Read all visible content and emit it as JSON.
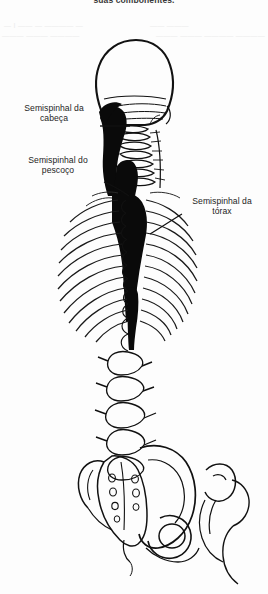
{
  "figure": {
    "title_fragment": "suas componentes.",
    "background_color": "#fdfdfd",
    "ink_color": "#111111",
    "muscle_fill_color": "#0a0a0a",
    "view": "posterior view of axial skeleton",
    "width": 268,
    "height": 594
  },
  "labels": [
    {
      "id": "semispinalis-capitis",
      "text": "Semispinhal da\ncabeça",
      "x": 14,
      "y": 104,
      "align": "center",
      "leader": "horizontal",
      "leader_from": [
        100,
        126
      ],
      "leader_to": [
        128,
        126
      ]
    },
    {
      "id": "semispinalis-cervicis",
      "text": "Semispinhal do\npescoço",
      "x": 16,
      "y": 156,
      "align": "center",
      "leader": "diagonal",
      "leader_from": [
        104,
        182
      ],
      "leader_to": [
        128,
        194
      ]
    },
    {
      "id": "semispinalis-thoracis",
      "text": "Semispinhal da\ntórax",
      "x": 183,
      "y": 197,
      "align": "center",
      "leader": "diagonal",
      "leader_from": [
        180,
        216
      ],
      "leader_to": [
        150,
        232
      ]
    }
  ],
  "ghost_text": [
    {
      "text": "— I ——  — ————  —",
      "x": 4,
      "y": 26
    },
    {
      "text": "———    ———  ————",
      "x": 2,
      "y": 36
    },
    {
      "text": "——  ———",
      "x": 4,
      "y": 46
    },
    {
      "text": "———  ——— ———— ————",
      "x": 150,
      "y": 24
    },
    {
      "text": "———— ——  ——— ————",
      "x": 156,
      "y": 34
    }
  ],
  "anatomy_parts": [
    {
      "name": "cranium-occipital",
      "region": "skull"
    },
    {
      "name": "cervical-vertebrae",
      "region": "neck"
    },
    {
      "name": "thoracic-vertebrae",
      "region": "thorax"
    },
    {
      "name": "rib-cage-left",
      "region": "thorax"
    },
    {
      "name": "rib-cage-right",
      "region": "thorax"
    },
    {
      "name": "lumbar-vertebrae",
      "region": "lumbar"
    },
    {
      "name": "sacrum",
      "region": "pelvis"
    },
    {
      "name": "ilium",
      "region": "pelvis"
    },
    {
      "name": "ischium-pubis",
      "region": "pelvis"
    },
    {
      "name": "femur-head",
      "region": "pelvis"
    },
    {
      "name": "semispinalis-muscle-mass",
      "region": "spine"
    }
  ]
}
